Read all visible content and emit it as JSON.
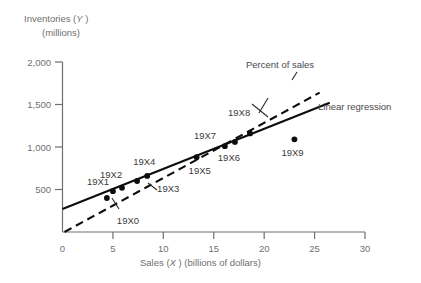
{
  "chart_data": {
    "type": "scatter",
    "title": "",
    "ylabel_line1": "Inventories (Y )",
    "ylabel_line2": "(millions)",
    "xlabel": "Sales (X ) (billions of dollars)",
    "xlabel_prefix": "Sales (",
    "xlabel_ital": "X",
    "xlabel_suffix": " ) (billions of dollars)",
    "ylabel_prefix": "Inventories (",
    "ylabel_ital": "Y",
    "ylabel_suffix": " )",
    "xlim": [
      0,
      30
    ],
    "ylim": [
      0,
      2000
    ],
    "grid": false,
    "xticks": [
      0,
      5,
      10,
      15,
      20,
      25,
      30
    ],
    "xtick_labels": [
      "0",
      "5",
      "10",
      "15",
      "20",
      "25",
      "30"
    ],
    "yticks": [
      500,
      1000,
      1500,
      2000
    ],
    "ytick_labels": [
      "500",
      "1,000",
      "1,500",
      "2,000"
    ],
    "points": [
      {
        "label": "19X0",
        "x": 4.4,
        "y": 400
      },
      {
        "label": "19X1",
        "x": 5.0,
        "y": 480
      },
      {
        "label": "19X2",
        "x": 5.9,
        "y": 520
      },
      {
        "label": "19X3",
        "x": 7.4,
        "y": 600
      },
      {
        "label": "19X4",
        "x": 8.4,
        "y": 660
      },
      {
        "label": "19X5",
        "x": 13.3,
        "y": 880
      },
      {
        "label": "19X6",
        "x": 16.1,
        "y": 1010
      },
      {
        "label": "19X7",
        "x": 17.1,
        "y": 1060
      },
      {
        "label": "19X8",
        "x": 18.6,
        "y": 1160
      },
      {
        "label": "19X9",
        "x": 23.0,
        "y": 1090
      }
    ],
    "series": [
      {
        "name": "Linear regression",
        "style": "solid",
        "x": [
          0,
          26.5
        ],
        "y": [
          270,
          1520
        ]
      },
      {
        "name": "Percent of sales",
        "style": "dashed",
        "x": [
          0.2,
          25.5
        ],
        "y": [
          0,
          1640
        ]
      }
    ],
    "annotations": [
      {
        "name": "percent-of-sales-label",
        "text": "Percent of sales"
      },
      {
        "name": "linear-regression-label",
        "text": "Linear regression"
      }
    ]
  }
}
